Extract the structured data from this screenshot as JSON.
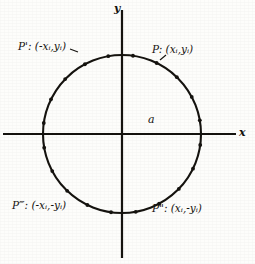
{
  "figure": {
    "background_color": "#fdfdfb",
    "ink_color": "#15130f"
  },
  "axes": {
    "x_label": "x",
    "y_label": "y",
    "origin": {
      "x": 122,
      "y": 134
    },
    "x_axis": {
      "from_x": 3,
      "to_x": 236,
      "y": 134
    },
    "y_axis": {
      "x": 122,
      "from_y": 10,
      "to_y": 258
    }
  },
  "circle": {
    "center_x": 122,
    "center_y": 134,
    "radius_px": 79,
    "radius_label": "a",
    "stroke_width": 2.1
  },
  "points": [
    {
      "id": "p",
      "label": "P: (xᵢ,yᵢ)",
      "quadrant": "upper-right"
    },
    {
      "id": "p-prime",
      "label": "P': (-xᵢ,yᵢ)",
      "quadrant": "upper-left"
    },
    {
      "id": "p-double",
      "label": "P\": (xᵢ,-yᵢ)",
      "quadrant": "lower-right"
    },
    {
      "id": "p-triple",
      "label": "P‴: (-xᵢ,-yᵢ)",
      "quadrant": "lower-left"
    }
  ],
  "tick_markers": {
    "description": "small dots spaced along the circle arc",
    "angles_deg": [
      10,
      28,
      46,
      64,
      82,
      100,
      118,
      136,
      154,
      172,
      190,
      208,
      226,
      244,
      262,
      280,
      298,
      316,
      334,
      352
    ]
  }
}
